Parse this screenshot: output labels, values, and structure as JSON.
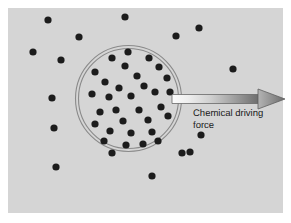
{
  "figure": {
    "type": "diagram",
    "canvas": {
      "width": 291,
      "height": 223
    },
    "panel": {
      "x": 8,
      "y": 8,
      "width": 275,
      "height": 205,
      "background_color": "#d5d5d5",
      "outer_background_color": "#ffffff"
    },
    "membrane": {
      "name": "double-ring-boundary",
      "shape": "circle",
      "center_x": 128.5,
      "center_y": 98.5,
      "outer_radius": 53,
      "inner_radius": 50,
      "stroke_color": "#8a8a8a",
      "stroke_width": 1,
      "fill": "none"
    },
    "particles": {
      "label": "solute particles",
      "color": "#1c1c1c",
      "radius": 3.6,
      "inside_count": 31,
      "outside_count": 16,
      "inside": [
        [
          128,
          52
        ],
        [
          112,
          58
        ],
        [
          149,
          58
        ],
        [
          95,
          72
        ],
        [
          125,
          66
        ],
        [
          159,
          67
        ],
        [
          137,
          76
        ],
        [
          105,
          82
        ],
        [
          119,
          88
        ],
        [
          144,
          86
        ],
        [
          167,
          78
        ],
        [
          92,
          94
        ],
        [
          109,
          97
        ],
        [
          131,
          96
        ],
        [
          155,
          92
        ],
        [
          170,
          92
        ],
        [
          100,
          112
        ],
        [
          116,
          110
        ],
        [
          139,
          110
        ],
        [
          161,
          107
        ],
        [
          123,
          121
        ],
        [
          148,
          120
        ],
        [
          168,
          116
        ],
        [
          95,
          124
        ],
        [
          110,
          131
        ],
        [
          131,
          133
        ],
        [
          152,
          132
        ],
        [
          104,
          141
        ],
        [
          126,
          145
        ],
        [
          143,
          144
        ],
        [
          158,
          141
        ]
      ],
      "outside": [
        [
          48,
          20
        ],
        [
          79,
          37
        ],
        [
          125,
          17
        ],
        [
          199,
          28
        ],
        [
          33,
          52
        ],
        [
          61,
          60
        ],
        [
          233,
          69
        ],
        [
          176,
          36
        ],
        [
          52,
          98
        ],
        [
          54,
          128
        ],
        [
          201,
          135
        ],
        [
          190,
          152
        ],
        [
          56,
          167
        ],
        [
          112,
          153
        ],
        [
          182,
          153
        ],
        [
          152,
          176
        ]
      ]
    },
    "arrow": {
      "name": "chemical-driving-force-arrow",
      "direction": "right",
      "shaft": {
        "x_start": 172,
        "x_end": 262,
        "y_center": 99,
        "thickness": 9
      },
      "head": {
        "x_base": 258,
        "x_tip": 285,
        "half_height": 10
      },
      "gradient_from": "#f7f7f7",
      "gradient_to": "#6e6e6e",
      "outline_color": "#5a5a5a"
    },
    "annotation": {
      "name": "arrow-label",
      "text": "Chemical driving\nforce",
      "line_1": "Chemical driving",
      "line_2": "force",
      "x": 193,
      "y": 108,
      "color": "#1a1a1a",
      "font_size_px": 9.5
    }
  }
}
